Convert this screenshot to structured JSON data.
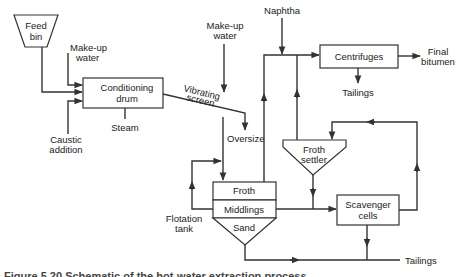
{
  "diagram": {
    "nodes": {
      "feed_bin": {
        "line1": "Feed",
        "line2": "bin"
      },
      "conditioning_drum": {
        "line1": "Conditioning",
        "line2": "drum"
      },
      "flotation_tank": {
        "froth": "Froth",
        "middlings": "Middlings",
        "sand": "Sand",
        "label_line1": "Flotation",
        "label_line2": "tank"
      },
      "centrifuges": {
        "label": "Centrifuges"
      },
      "froth_settler": {
        "line1": "Froth",
        "line2": "settler"
      },
      "scavenger_cells": {
        "line1": "Scavenger",
        "line2": "cells"
      }
    },
    "streams": {
      "makeup_water_1": {
        "line1": "Make-up",
        "line2": "water"
      },
      "caustic": {
        "line1": "Caustic",
        "line2": "addition"
      },
      "steam": "Steam",
      "vibrating_screen": {
        "line1": "Vibrating",
        "line2": "screen"
      },
      "makeup_water_2": {
        "line1": "Make-up",
        "line2": "water"
      },
      "oversize": "Oversize",
      "naphtha": "Naphtha",
      "final_bitumen": {
        "line1": "Final",
        "line2": "bitumen"
      },
      "centrifuge_tailings": "Tailings",
      "tailings": "Tailings"
    },
    "colors": {
      "line": "#333333",
      "text": "#222222",
      "background": "#ffffff"
    }
  },
  "caption": "Figure 5.20 Schematic of the hot-water extraction process"
}
